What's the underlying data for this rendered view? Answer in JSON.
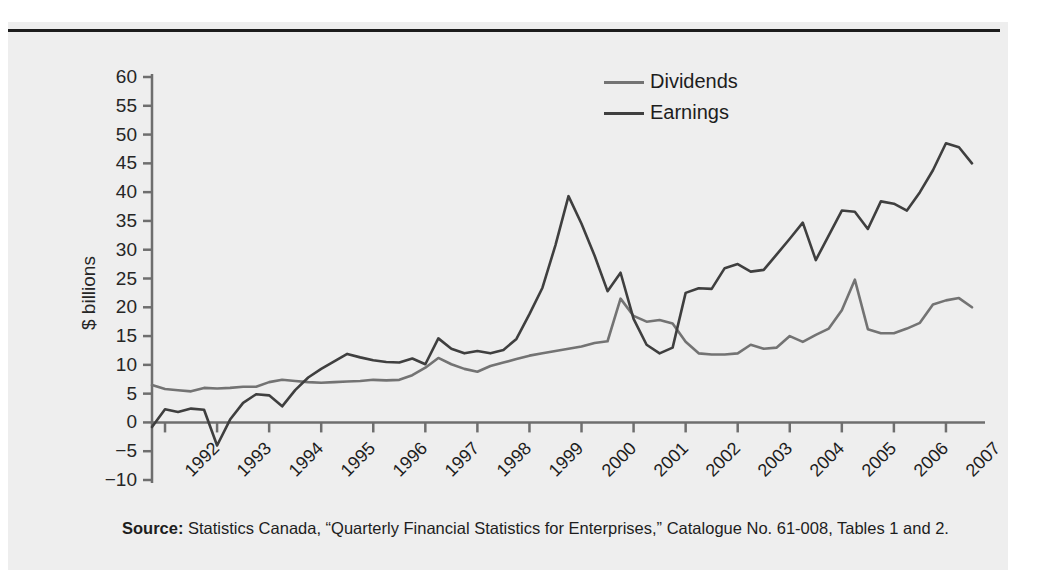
{
  "figure": {
    "background_color": "#eeeeee",
    "rule_color": "#1d1d1d"
  },
  "source": {
    "label": "Source:",
    "text": " Statistics Canada, “Quarterly Financial Statistics for Enterprises,” Catalogue No. 61-008, Tables 1 and 2."
  },
  "legend": {
    "position": "top-center-right",
    "entries": [
      {
        "name": "Dividends",
        "color": "#737373"
      },
      {
        "name": "Earnings",
        "color": "#3f3f3f"
      }
    ]
  },
  "chart_data": {
    "type": "line",
    "title": "",
    "xlabel": "",
    "ylabel": "$ billions",
    "ylim": [
      -10,
      60
    ],
    "yticks": [
      60,
      55,
      50,
      45,
      40,
      35,
      30,
      25,
      20,
      15,
      10,
      5,
      0,
      -5,
      -10
    ],
    "ytick_labels": [
      "60",
      "55",
      "50",
      "45",
      "40",
      "35",
      "30",
      "25",
      "20",
      "15",
      "10",
      "5",
      "0",
      "−5",
      "−10"
    ],
    "grid": false,
    "x_tick_labels": [
      "1992",
      "1993",
      "1994",
      "1995",
      "1996",
      "1997",
      "1998",
      "1999",
      "2000",
      "2001",
      "2002",
      "2003",
      "2004",
      "2005",
      "2006",
      "2007"
    ],
    "x_range": [
      1991.75,
      2007.75
    ],
    "x_frequency": "quarterly",
    "series": [
      {
        "name": "Dividends",
        "color": "#737373",
        "x": [
          1991.75,
          1992.0,
          1992.25,
          1992.5,
          1992.75,
          1993.0,
          1993.25,
          1993.5,
          1993.75,
          1994.0,
          1994.25,
          1994.5,
          1994.75,
          1995.0,
          1995.25,
          1995.5,
          1995.75,
          1996.0,
          1996.25,
          1996.5,
          1996.75,
          1997.0,
          1997.25,
          1997.5,
          1997.75,
          1998.0,
          1998.25,
          1998.5,
          1998.75,
          1999.0,
          1999.25,
          1999.5,
          1999.75,
          2000.0,
          2000.25,
          2000.5,
          2000.75,
          2001.0,
          2001.25,
          2001.5,
          2001.75,
          2002.0,
          2002.25,
          2002.5,
          2002.75,
          2003.0,
          2003.25,
          2003.5,
          2003.75,
          2004.0,
          2004.25,
          2004.5,
          2004.75,
          2005.0,
          2005.25,
          2005.5,
          2005.75,
          2006.0,
          2006.25,
          2006.5,
          2006.75,
          2007.0,
          2007.25,
          2007.5
        ],
        "values": [
          6.5,
          5.8,
          5.6,
          5.4,
          6.0,
          5.9,
          6.0,
          6.2,
          6.2,
          7.0,
          7.4,
          7.2,
          7.0,
          6.9,
          7.0,
          7.1,
          7.2,
          7.4,
          7.3,
          7.4,
          8.2,
          9.5,
          11.2,
          10.1,
          9.3,
          8.8,
          9.8,
          10.4,
          11.0,
          11.6,
          12.0,
          12.4,
          12.8,
          13.2,
          13.8,
          14.1,
          21.5,
          18.5,
          17.5,
          17.8,
          17.2,
          14.0,
          12.0,
          11.8,
          11.8,
          12.0,
          13.5,
          12.8,
          13.0,
          15.0,
          14.0,
          15.2,
          16.3,
          19.5,
          24.8,
          16.2,
          15.5,
          15.5,
          16.3,
          17.3,
          20.5,
          21.2,
          21.6,
          20.0
        ]
      },
      {
        "name": "Earnings",
        "color": "#3f3f3f",
        "x": [
          1991.75,
          1992.0,
          1992.25,
          1992.5,
          1992.75,
          1993.0,
          1993.25,
          1993.5,
          1993.75,
          1994.0,
          1994.25,
          1994.5,
          1994.75,
          1995.0,
          1995.25,
          1995.5,
          1995.75,
          1996.0,
          1996.25,
          1996.5,
          1996.75,
          1997.0,
          1997.25,
          1997.5,
          1997.75,
          1998.0,
          1998.25,
          1998.5,
          1998.75,
          1999.0,
          1999.25,
          1999.5,
          1999.75,
          2000.0,
          2000.25,
          2000.5,
          2000.75,
          2001.0,
          2001.25,
          2001.5,
          2001.75,
          2002.0,
          2002.25,
          2002.5,
          2002.75,
          2003.0,
          2003.25,
          2003.5,
          2003.75,
          2004.0,
          2004.25,
          2004.5,
          2004.75,
          2005.0,
          2005.25,
          2005.5,
          2005.75,
          2006.0,
          2006.25,
          2006.5,
          2006.75,
          2007.0,
          2007.25,
          2007.5
        ],
        "values": [
          -0.8,
          2.3,
          1.8,
          2.4,
          2.2,
          -4.0,
          0.5,
          3.4,
          4.9,
          4.7,
          2.8,
          5.6,
          7.8,
          9.3,
          10.6,
          11.9,
          11.3,
          10.8,
          10.5,
          10.4,
          11.1,
          10.1,
          14.6,
          12.8,
          12.0,
          12.4,
          12.0,
          12.6,
          14.5,
          18.8,
          23.4,
          30.8,
          39.3,
          34.5,
          29.0,
          22.8,
          26.0,
          18.0,
          13.5,
          12.0,
          13.0,
          22.5,
          23.3,
          23.2,
          26.8,
          27.5,
          26.2,
          26.5,
          29.2,
          31.9,
          34.7,
          28.2,
          32.5,
          36.8,
          36.6,
          33.6,
          38.4,
          38.0,
          36.8,
          40.0,
          43.8,
          48.5,
          47.8,
          45.0
        ]
      }
    ]
  }
}
